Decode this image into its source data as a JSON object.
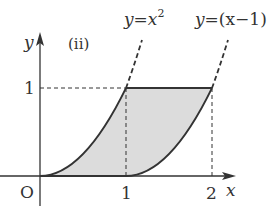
{
  "figure": {
    "panel_label": "(ii)",
    "colors": {
      "stroke": "#333333",
      "shade": "#dcdcdc",
      "background": "#ffffff"
    },
    "axes": {
      "x_label": "x",
      "y_label": "y",
      "origin_label": "O",
      "x_ticks": [
        "1",
        "2"
      ],
      "y_ticks": [
        "1"
      ]
    },
    "curves": [
      {
        "id": "parabola",
        "label_y": "y",
        "label_eq": "=",
        "label_rhs": "x",
        "label_sup": "2",
        "expression": "y = x^2"
      },
      {
        "id": "shifted-parabola",
        "label_y": "y",
        "label_eq": "=",
        "label_rhs": "(x−1)",
        "expression": "y = (x-1)^2"
      }
    ],
    "shaded_region": {
      "description": "Region bounded by y = x^2 (left), y = (x-1)^2 (right), y = 0 and y = 1",
      "x_range": [
        0,
        2
      ],
      "y_range": [
        0,
        1
      ]
    },
    "guide_lines": [
      {
        "type": "horizontal-dashed",
        "at_y": 1,
        "from_x": 0,
        "to_x": 1
      },
      {
        "type": "vertical-dashed",
        "at_x": 1,
        "from_y": 0,
        "to_y": 1
      },
      {
        "type": "vertical-dashed",
        "at_x": 2,
        "from_y": 0,
        "to_y": 1
      }
    ]
  }
}
